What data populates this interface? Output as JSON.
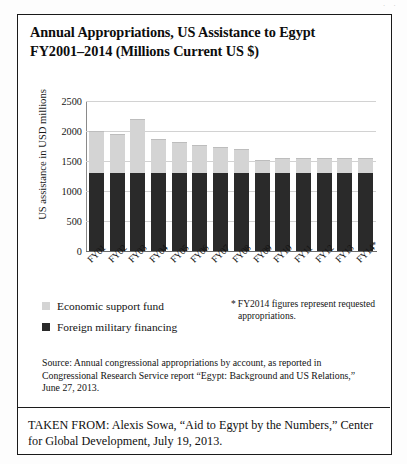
{
  "page": {
    "corner_mark": "· ·"
  },
  "title": {
    "line1": "Annual Appropriations, US Assistance to Egypt",
    "line2": "FY2001–2014 (Millions Current US $)"
  },
  "chart_data": {
    "type": "bar",
    "stacked": true,
    "title": "Annual Appropriations, US Assistance to Egypt FY2001–2014 (Millions Current US $)",
    "xlabel": "",
    "ylabel": "US assistance in USD millions",
    "ylim": [
      0,
      2500
    ],
    "yticks": [
      0,
      500,
      1000,
      1500,
      2000,
      2500
    ],
    "ytick_labels": [
      "0",
      "500",
      "1000",
      "1500",
      "2000",
      "2500"
    ],
    "grid": true,
    "grid_axis": "y",
    "legend_position": "below-left",
    "categories": [
      "FY01",
      "FY02",
      "FY03",
      "FY04",
      "FY05",
      "FY06",
      "FY07",
      "FY08",
      "FY09",
      "FY10",
      "FY11",
      "FY12",
      "FY13",
      "FY14*"
    ],
    "series": [
      {
        "name": "Foreign military financing",
        "color": "#2a2a2a",
        "values": [
          1300,
          1300,
          1300,
          1300,
          1300,
          1300,
          1300,
          1300,
          1300,
          1300,
          1300,
          1300,
          1300,
          1300
        ]
      },
      {
        "name": "Economic support fund",
        "color": "#d4d4d4",
        "values": [
          695,
          655,
          905,
          565,
          510,
          465,
          440,
          405,
          220,
          255,
          255,
          255,
          255,
          250
        ]
      }
    ],
    "totals": [
      1995,
      1955,
      2205,
      1865,
      1810,
      1765,
      1740,
      1705,
      1520,
      1555,
      1555,
      1555,
      1555,
      1550
    ],
    "annotations": [
      "* FY2014 figures represent requested appropriations."
    ]
  },
  "legend": {
    "items": [
      {
        "label": "Economic support fund",
        "color": "#d4d4d4"
      },
      {
        "label": "Foreign military financing",
        "color": "#2a2a2a"
      }
    ]
  },
  "footnote": {
    "marker": "*",
    "line1": "FY2014 figures represent requested",
    "line2": "appropriations."
  },
  "source": {
    "text": "Source: Annual congressional appropriations by account, as reported in Congressional Research Service report “Egypt: Background and US Relations,” June 27, 2013."
  },
  "taken_from": {
    "text": "TAKEN FROM: Alexis Sowa, “Aid to Egypt by the Numbers,” Center for Global Development, July 19, 2013."
  }
}
